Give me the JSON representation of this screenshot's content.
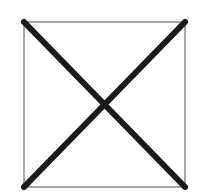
{
  "graphic": {
    "kind": "image-placeholder",
    "icon": "x-mark-in-box-icon",
    "box": {
      "x": 24,
      "y": 22,
      "width": 161,
      "height": 165,
      "stroke": "#8a8a8a",
      "stroke_width": 1.5
    },
    "cross": {
      "stroke": "#1a1a1a",
      "stroke_width": 6,
      "lines": [
        {
          "x1": 24,
          "y1": 22,
          "x2": 185,
          "y2": 187
        },
        {
          "x1": 185,
          "y1": 22,
          "x2": 24,
          "y2": 187
        }
      ]
    },
    "background": "#ffffff"
  }
}
